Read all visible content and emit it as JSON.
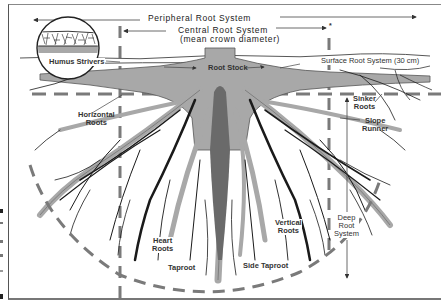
{
  "diagram": {
    "labels": {
      "peripheral": "Peripheral Root System",
      "central_line1": "Central Root System",
      "central_line2": "(mean crown diameter)",
      "humus": "Humus Strivers",
      "root_stock": "Root Stock",
      "surface": "Surface Root System  (30 cm)",
      "horizontal_line1": "Horizontal",
      "horizontal_line2": "Roots",
      "sinker_line1": "Sinker",
      "sinker_line2": "Roots",
      "slope_line1": "Slope",
      "slope_line2": "Runner",
      "deep_line1": "Deep",
      "deep_line2": "Root",
      "deep_line3": "System",
      "heart_line1": "Heart",
      "heart_line2": "Roots",
      "vertical_line1": "Vertical",
      "vertical_line2": "Roots",
      "taproot": "Taproot",
      "side_taproot": "Side Taproot",
      "asterisk": "*"
    },
    "colors": {
      "root_gray": "#a8a8a8",
      "root_dark": "#1a1a1a",
      "taproot_dark": "#6a6a6a",
      "dash_gray": "#7a7a7a",
      "text": "#333333"
    }
  }
}
